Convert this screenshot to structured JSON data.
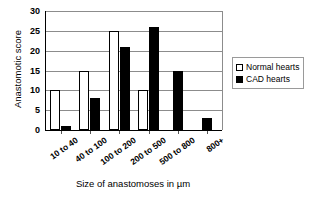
{
  "chart_data": {
    "type": "bar",
    "title": "",
    "xlabel": "Size of anastomoses in µm",
    "ylabel": "Anastomotic score",
    "categories": [
      "10 to 40",
      "40 to 100",
      "100 to 200",
      "200 to 500",
      "500 to 800",
      "800+"
    ],
    "series": [
      {
        "name": "Normal hearts",
        "color": "#ffffff",
        "values": [
          10,
          15,
          25,
          10,
          0,
          0
        ]
      },
      {
        "name": "CAD hearts",
        "color": "#000000",
        "values": [
          1,
          8,
          21,
          26,
          15,
          3
        ]
      }
    ],
    "ylim": [
      0,
      30
    ],
    "yticks": [
      0,
      5,
      10,
      15,
      20,
      25,
      30
    ],
    "ytick_labels": [
      "0",
      "5",
      "10",
      "15",
      "20",
      "25",
      "30"
    ],
    "grid": true,
    "legend_position": "right"
  },
  "legend": {
    "items": [
      {
        "label": "Normal hearts",
        "swatch": "open-square"
      },
      {
        "label": "CAD hearts",
        "swatch": "filled-square"
      }
    ]
  }
}
